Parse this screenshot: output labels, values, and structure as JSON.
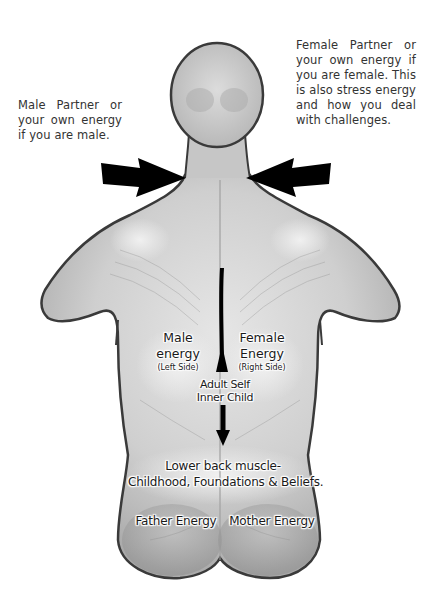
{
  "notes": {
    "male_partner": "Male Partner or your own energy if you are male.",
    "female_partner": "Female Partner or your own energy if you are female. This is also stress energy and how you deal with challenges."
  },
  "labels": {
    "male_energy": {
      "title_line1": "Male",
      "title_line2": "energy",
      "side": "(Left Side)"
    },
    "female_energy": {
      "title_line1": "Female",
      "title_line2": "Energy",
      "side": "(Right Side)"
    },
    "spine": {
      "line1": "Adult Self",
      "line2": "Inner Child"
    },
    "lower_back": {
      "line1": "Lower back muscle-",
      "line2": "Childhood, Foundations & Beliefs."
    },
    "father_energy": "Father Energy",
    "mother_energy": "Mother Energy"
  },
  "arrows": {
    "left_neck": "arrow-right-pointing",
    "right_neck": "arrow-left-pointing",
    "spine": "double-headed-vertical-arrow"
  },
  "colors": {
    "body_fill": "#c8c8c8",
    "body_outline": "#3a3a3a",
    "arrow": "#000000",
    "text": "#333333"
  }
}
